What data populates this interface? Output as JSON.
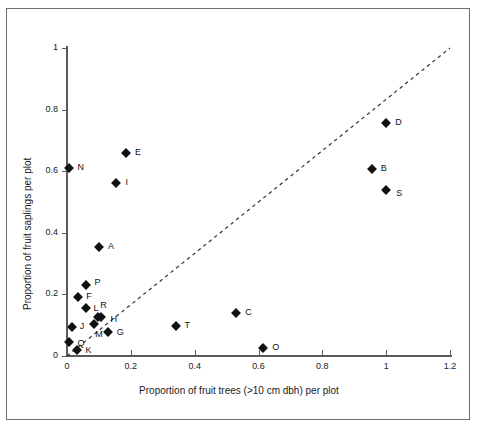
{
  "figure": {
    "background_color": "#ffffff",
    "border_color": "#6d6d6d",
    "marker_color": "#111111",
    "axis_color": "#5a5a5a",
    "reference_line_style": "dashed"
  },
  "chart_data": {
    "type": "scatter",
    "title": "",
    "xlabel": "Proportion of fruit trees (>10 cm dbh) per plot",
    "ylabel": "Proportion of fruit saplings per plot",
    "xlim": [
      0,
      1.2
    ],
    "ylim": [
      0,
      1
    ],
    "xticks": [
      0,
      0.2,
      0.4,
      0.6,
      0.8,
      1,
      1.2
    ],
    "xticklabels": [
      "0",
      "0.2",
      "0.4",
      "0.6",
      "0.8",
      "1",
      "1.2"
    ],
    "yticks": [
      0,
      0.2,
      0.4,
      0.6,
      0.8,
      1
    ],
    "yticklabels": [
      "0",
      "0.2",
      "0.4",
      "0.6",
      "0.8",
      "1"
    ],
    "grid": false,
    "legend": null,
    "reference_line": {
      "label": "1:1 line",
      "from": [
        0,
        0
      ],
      "to": [
        1.2,
        1.0
      ],
      "style": "dashed"
    },
    "points": [
      {
        "label": "A",
        "x": 0.1,
        "y": 0.355,
        "label_dx": 9,
        "label_dy": 0
      },
      {
        "label": "B",
        "x": 0.955,
        "y": 0.607,
        "label_dx": 9,
        "label_dy": 0
      },
      {
        "label": "C",
        "x": 0.53,
        "y": 0.138,
        "label_dx": 9,
        "label_dy": 0
      },
      {
        "label": "D",
        "x": 1.0,
        "y": 0.758,
        "label_dx": 9,
        "label_dy": 0
      },
      {
        "label": "E",
        "x": 0.185,
        "y": 0.66,
        "label_dx": 9,
        "label_dy": 0
      },
      {
        "label": "F",
        "x": 0.035,
        "y": 0.19,
        "label_dx": 8,
        "label_dy": 0
      },
      {
        "label": "G",
        "x": 0.128,
        "y": 0.078,
        "label_dx": 9,
        "label_dy": 1
      },
      {
        "label": "H",
        "x": 0.108,
        "y": 0.127,
        "label_dx": 9,
        "label_dy": 3
      },
      {
        "label": "I",
        "x": 0.155,
        "y": 0.562,
        "label_dx": 9,
        "label_dy": 0
      },
      {
        "label": "J",
        "x": 0.015,
        "y": 0.095,
        "label_dx": 8,
        "label_dy": 0
      },
      {
        "label": "K",
        "x": 0.03,
        "y": 0.018,
        "label_dx": 9,
        "label_dy": 1
      },
      {
        "label": "L",
        "x": 0.058,
        "y": 0.157,
        "label_dx": 8,
        "label_dy": 1
      },
      {
        "label": "M",
        "x": 0.085,
        "y": 0.105,
        "label_dx": 1,
        "label_dy": 11
      },
      {
        "label": "N",
        "x": 0.005,
        "y": 0.61,
        "label_dx": 9,
        "label_dy": 0
      },
      {
        "label": "O",
        "x": 0.615,
        "y": 0.025,
        "label_dx": 9,
        "label_dy": 0
      },
      {
        "label": "P",
        "x": 0.058,
        "y": 0.232,
        "label_dx": 9,
        "label_dy": -2
      },
      {
        "label": "Q",
        "x": 0.005,
        "y": 0.047,
        "label_dx": 9,
        "label_dy": 2
      },
      {
        "label": "R",
        "x": 0.098,
        "y": 0.128,
        "label_dx": 2,
        "label_dy": -11
      },
      {
        "label": "S",
        "x": 1.0,
        "y": 0.54,
        "label_dx": 10,
        "label_dy": 4
      },
      {
        "label": "T",
        "x": 0.34,
        "y": 0.098,
        "label_dx": 9,
        "label_dy": 0
      }
    ]
  }
}
